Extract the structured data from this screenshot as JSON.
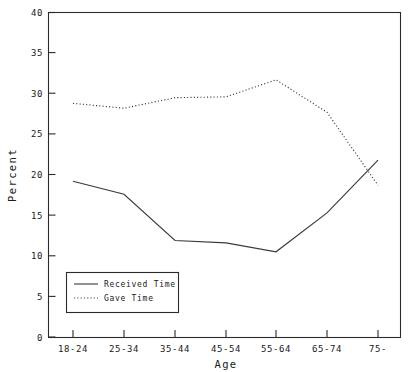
{
  "chart_data": {
    "type": "line",
    "title": "",
    "subtitle": "",
    "xlabel": "Age",
    "ylabel": "Percent",
    "categories": [
      "18-24",
      "25-34",
      "35-44",
      "45-54",
      "55-64",
      "65-74",
      "75-"
    ],
    "series": [
      {
        "name": "Received Time",
        "style": "solid",
        "values": [
          19.2,
          17.6,
          11.9,
          11.6,
          10.5,
          15.3,
          21.8
        ]
      },
      {
        "name": "Gave Time",
        "style": "dotted",
        "values": [
          28.8,
          28.2,
          29.5,
          29.6,
          31.7,
          27.7,
          18.7
        ]
      }
    ],
    "ylim": [
      0,
      40
    ],
    "yticks": [
      0,
      5,
      10,
      15,
      20,
      25,
      30,
      35,
      40
    ],
    "ytick_labels": [
      "0",
      "5",
      "10",
      "15",
      "20",
      "25",
      "30",
      "35",
      "40"
    ],
    "xtick_labels": [
      "18-24",
      "25-34",
      "35-44",
      "45-54",
      "55-64",
      "65-74",
      "75-"
    ],
    "grid": false,
    "legend_position": "lower-left",
    "colors": {
      "axis": "#2b2b2b",
      "series": "#3a3a3a",
      "background": "#ffffff",
      "text": "#1a1a1a"
    }
  },
  "legend": {
    "entries": [
      {
        "label": "Received Time",
        "style": "solid"
      },
      {
        "label": "Gave Time",
        "style": "dotted"
      }
    ]
  },
  "axes": {
    "y_title": "Percent",
    "x_title": "Age"
  }
}
